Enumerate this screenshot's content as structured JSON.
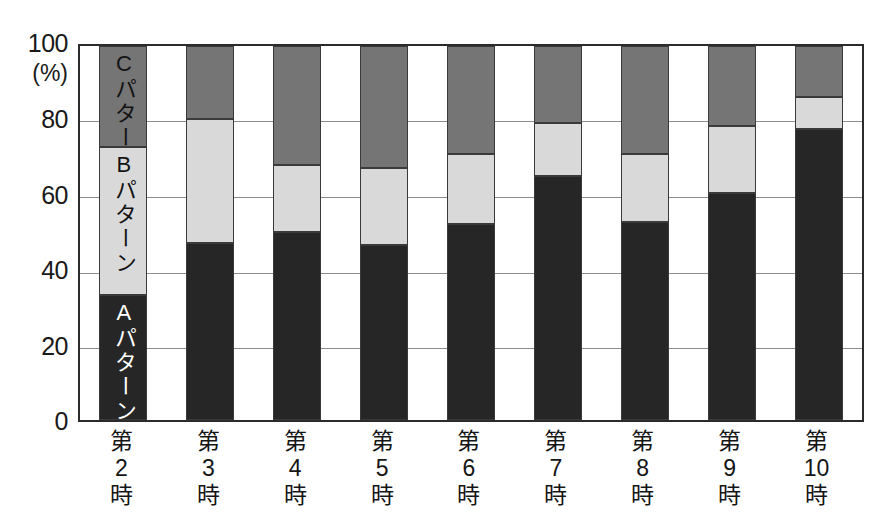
{
  "chart_data": {
    "type": "bar",
    "subtype": "stacked-100-percent",
    "title": "",
    "xlabel": "",
    "ylabel": "(%)",
    "ylim": [
      0,
      100
    ],
    "yticks": [
      0,
      20,
      40,
      60,
      80,
      100
    ],
    "ytick_labels": [
      "0",
      "20",
      "40",
      "60",
      "80",
      "100"
    ],
    "grid": true,
    "grid_axis": "y",
    "legend_position": "inline-first-bar",
    "categories": [
      "第2時",
      "第3時",
      "第4時",
      "第5時",
      "第6時",
      "第7時",
      "第8時",
      "第9時",
      "第10時"
    ],
    "series": [
      {
        "name": "Aパターン",
        "color": "#262626",
        "label_color": "#ffffff",
        "values": [
          33.5,
          47.4,
          50.3,
          46.8,
          52.4,
          65.3,
          52.9,
          60.6,
          77.8
        ]
      },
      {
        "name": "Bパターン",
        "color": "#d9d9d9",
        "label_color": "#131313",
        "values": [
          39.4,
          33.1,
          18.0,
          20.6,
          18.8,
          14.0,
          18.3,
          18.0,
          8.5
        ]
      },
      {
        "name": "Cパターン",
        "color": "#757575",
        "label_color": "#131313",
        "values": [
          27.1,
          19.5,
          31.7,
          32.6,
          28.8,
          20.7,
          28.8,
          21.4,
          13.7
        ]
      }
    ],
    "cumulative_tops": [
      {
        "category": "第2時",
        "a_top": 33.5,
        "b_top": 72.9,
        "c_top": 100
      },
      {
        "category": "第3時",
        "a_top": 47.4,
        "b_top": 80.5,
        "c_top": 100
      },
      {
        "category": "第4時",
        "a_top": 50.3,
        "b_top": 68.3,
        "c_top": 100
      },
      {
        "category": "第5時",
        "a_top": 46.8,
        "b_top": 67.4,
        "c_top": 100
      },
      {
        "category": "第6時",
        "a_top": 52.4,
        "b_top": 71.2,
        "c_top": 100
      },
      {
        "category": "第7時",
        "a_top": 65.3,
        "b_top": 79.3,
        "c_top": 100
      },
      {
        "category": "第8時",
        "a_top": 52.9,
        "b_top": 71.2,
        "c_top": 100
      },
      {
        "category": "第9時",
        "a_top": 60.6,
        "b_top": 78.6,
        "c_top": 100
      },
      {
        "category": "第10時",
        "a_top": 77.8,
        "b_top": 86.3,
        "c_top": 100
      }
    ],
    "inline_labels": {
      "bar_index": 0,
      "a_label": "Aパターン",
      "b_label": "Bパターン",
      "c_label": "Cパターン"
    }
  },
  "axes": {
    "y_unit": "(%)",
    "y_tick_labels": [
      "100",
      "80",
      "60",
      "40",
      "20",
      "0"
    ],
    "x_tick_labels": [
      [
        "第",
        "2",
        "時"
      ],
      [
        "第",
        "3",
        "時"
      ],
      [
        "第",
        "4",
        "時"
      ],
      [
        "第",
        "5",
        "時"
      ],
      [
        "第",
        "6",
        "時"
      ],
      [
        "第",
        "7",
        "時"
      ],
      [
        "第",
        "8",
        "時"
      ],
      [
        "第",
        "9",
        "時"
      ],
      [
        "第",
        "10",
        "時"
      ]
    ]
  },
  "colors": {
    "series_a": "#262626",
    "series_b": "#d9d9d9",
    "series_c": "#757575",
    "frame": "#2b2b2b",
    "gridline": "#8c8c8c",
    "background": "#ffffff",
    "text": "#151515"
  }
}
